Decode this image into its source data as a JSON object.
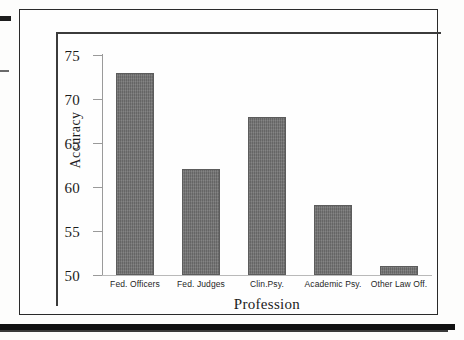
{
  "figure": {
    "background_color": "#fefefe",
    "frame_color": "#2a2a2a",
    "bar_color": "#6e6e6e"
  },
  "artifacts": {
    "scan_mark_top": "",
    "scan_mark_mid": "",
    "page_bottom_rule": "",
    "axis_stub": ""
  },
  "chart_data": {
    "type": "bar",
    "title": "",
    "xlabel": "Profession",
    "ylabel": "Accuracy",
    "categories": [
      "Fed. Officers",
      "Fed. Judges",
      "Clin.Psy.",
      "Academic Psy.",
      "Other Law Off."
    ],
    "values": [
      73,
      62,
      68,
      58,
      51
    ],
    "ylim": [
      50,
      75
    ],
    "yticks": [
      50,
      55,
      60,
      65,
      70,
      75
    ],
    "ytick_labels": [
      "50",
      "55",
      "60",
      "65",
      "70",
      "75"
    ],
    "grid": false,
    "legend": null,
    "legend_position": "none",
    "bar_color": "#6e6e6e"
  }
}
